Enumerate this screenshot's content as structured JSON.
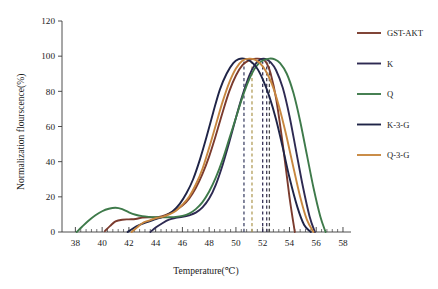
{
  "chart_data": {
    "type": "line",
    "title": "",
    "subtitle": "",
    "xlabel": "Temperature(℃)",
    "ylabel": "Normalization flourscence(%)",
    "xlim": [
      37,
      58.6
    ],
    "ylim": [
      0,
      120
    ],
    "xticks": [
      38,
      40,
      42,
      44,
      46,
      48,
      50,
      52,
      54,
      56,
      58
    ],
    "yticks": [
      0,
      20,
      40,
      60,
      80,
      100,
      120
    ],
    "xtick_labels": [
      "38",
      "40",
      "42",
      "44",
      "46",
      "48",
      "50",
      "52",
      "54",
      "56",
      "58"
    ],
    "ytick_labels": [
      "0",
      "20",
      "40",
      "60",
      "80",
      "100",
      "120"
    ],
    "x_minor_interval": 0.4,
    "grid": false,
    "legend_position": "right",
    "series": [
      {
        "name": "GST-AKT",
        "color": "#7B3B2E",
        "tm": 52.3,
        "x": [
          40.2,
          40.6,
          41.0,
          41.5,
          42.0,
          42.5,
          43.0,
          43.5,
          44.0,
          44.5,
          45.0,
          45.5,
          46.0,
          46.5,
          47.0,
          47.5,
          48.0,
          48.5,
          49.0,
          49.5,
          50.0,
          50.5,
          51.0,
          51.5,
          52.0,
          52.3,
          52.6,
          53.0,
          53.5,
          54.0,
          54.4
        ],
        "y": [
          0.5,
          3.5,
          6.0,
          7.0,
          7.2,
          7.4,
          8.2,
          8.4,
          8.3,
          9.0,
          10.5,
          12.5,
          15.0,
          19.0,
          25.0,
          33.0,
          43.0,
          55.0,
          68.0,
          80.0,
          89.0,
          95.0,
          97.8,
          98.6,
          98.2,
          96.0,
          90.0,
          76.0,
          50.0,
          20.0,
          0.0
        ]
      },
      {
        "name": "K",
        "color": "#2E2A52",
        "tm": 52.0,
        "x": [
          43.6,
          44.0,
          44.5,
          45.0,
          45.5,
          46.0,
          46.5,
          47.0,
          47.5,
          48.0,
          48.5,
          49.0,
          49.5,
          50.0,
          50.5,
          51.0,
          51.4,
          51.8,
          52.2,
          52.6,
          53.0,
          53.5,
          54.0,
          54.5,
          55.0,
          55.5,
          55.9
        ],
        "y": [
          0.0,
          2.5,
          5.0,
          7.0,
          8.0,
          8.6,
          9.5,
          11.0,
          14.0,
          19.0,
          27.0,
          38.0,
          51.0,
          65.0,
          78.0,
          89.0,
          95.0,
          98.0,
          98.4,
          96.5,
          92.0,
          82.0,
          66.0,
          46.0,
          26.0,
          9.0,
          0.0
        ]
      },
      {
        "name": "Q",
        "color": "#3E7A4A",
        "tm": 52.5,
        "x": [
          38.1,
          38.5,
          39.0,
          39.5,
          40.0,
          40.5,
          41.0,
          41.5,
          42.0,
          42.5,
          43.0,
          43.5,
          44.0,
          44.5,
          45.0,
          45.5,
          46.0,
          46.5,
          47.0,
          47.5,
          48.0,
          48.5,
          49.0,
          49.5,
          50.0,
          50.5,
          51.0,
          51.5,
          52.0,
          52.5,
          52.9,
          53.3,
          53.8,
          54.3,
          54.8,
          55.3,
          55.8,
          56.3,
          56.7
        ],
        "y": [
          0.0,
          3.0,
          6.5,
          9.5,
          11.8,
          13.2,
          13.8,
          13.0,
          11.2,
          9.8,
          9.0,
          8.6,
          8.4,
          8.3,
          8.4,
          8.6,
          9.2,
          10.5,
          13.0,
          17.0,
          23.0,
          31.0,
          41.0,
          53.0,
          65.0,
          77.0,
          87.0,
          94.0,
          97.5,
          98.6,
          98.2,
          96.0,
          90.0,
          79.0,
          63.0,
          44.0,
          25.0,
          9.0,
          0.0
        ]
      },
      {
        "name": "K-3-G",
        "color": "#1F2447",
        "tm": 50.6,
        "x": [
          41.9,
          42.3,
          42.8,
          43.3,
          43.8,
          44.3,
          44.8,
          45.3,
          45.8,
          46.3,
          46.8,
          47.3,
          47.8,
          48.3,
          48.8,
          49.3,
          49.8,
          50.2,
          50.6,
          51.0,
          51.5,
          52.0,
          52.5,
          53.0,
          53.5,
          54.0,
          54.6,
          55.1,
          55.6
        ],
        "y": [
          0.0,
          2.0,
          4.0,
          5.5,
          6.8,
          8.0,
          9.5,
          12.0,
          16.0,
          22.0,
          30.0,
          41.0,
          54.0,
          68.0,
          81.0,
          90.0,
          96.0,
          98.3,
          98.6,
          97.5,
          94.0,
          87.0,
          77.0,
          64.0,
          48.0,
          31.0,
          14.0,
          4.0,
          0.0
        ]
      },
      {
        "name": "Q-3-G",
        "color": "#C8873F",
        "tm": 51.2,
        "x": [
          42.2,
          42.6,
          43.0,
          43.5,
          44.0,
          44.5,
          45.0,
          45.5,
          46.0,
          46.5,
          47.0,
          47.5,
          48.0,
          48.5,
          49.0,
          49.5,
          50.0,
          50.5,
          51.0,
          51.4,
          51.8,
          52.2,
          52.7,
          53.2,
          53.7,
          54.2,
          54.8,
          55.3,
          55.8
        ],
        "y": [
          0.0,
          2.5,
          5.0,
          6.5,
          7.8,
          8.6,
          10.0,
          12.0,
          15.5,
          20.0,
          27.0,
          36.0,
          48.0,
          61.0,
          74.0,
          85.0,
          93.0,
          97.5,
          98.6,
          98.0,
          96.0,
          92.0,
          84.0,
          72.0,
          57.0,
          40.0,
          20.0,
          7.0,
          0.0
        ]
      }
    ],
    "tm_markers": [
      {
        "series": "K-3-G",
        "value": 50.6,
        "color": "#3A3F63"
      },
      {
        "series": "Q-3-G",
        "value": 51.2,
        "color": "#B09A55"
      },
      {
        "series": "K",
        "value": 52.0,
        "color": "#2E2A52"
      },
      {
        "series": "GST-AKT",
        "value": 52.3,
        "color": "#3A3552"
      },
      {
        "series": "Q",
        "value": 52.5,
        "color": "#4A4A4A"
      }
    ]
  },
  "legend": {
    "items": [
      {
        "label": "GST-AKT",
        "color": "#7B3B2E"
      },
      {
        "label": "K",
        "color": "#2E2A52"
      },
      {
        "label": "Q",
        "color": "#3E7A4A"
      },
      {
        "label": "K-3-G",
        "color": "#1F2447"
      },
      {
        "label": "Q-3-G",
        "color": "#C8873F"
      }
    ]
  }
}
